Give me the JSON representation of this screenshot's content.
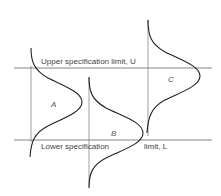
{
  "diagram": {
    "upper_limit_label": "Upper specification limit, U",
    "lower_limit_label_left": "Lower specification",
    "lower_limit_label_right": "limit, L",
    "curves": [
      {
        "name": "A"
      },
      {
        "name": "B"
      },
      {
        "name": "C"
      }
    ],
    "colors": {
      "line": "#222222",
      "guide": "#666666"
    }
  }
}
